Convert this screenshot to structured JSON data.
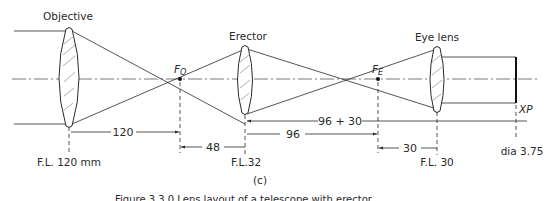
{
  "diagram": {
    "panel_label": "(c)",
    "caption_fragment": "Figure 3.3.0  Lens layout of a telescope with erector",
    "components": {
      "objective": {
        "label": "Objective",
        "focal_length_label": "F.L. 120 mm"
      },
      "erector": {
        "label": "Erector",
        "focal_length_label": "F.L.32"
      },
      "eye_lens": {
        "label": "Eye lens",
        "focal_length_label": "F.L. 30"
      },
      "exit_pupil": {
        "label": "XP",
        "diameter_label": "dia 3.75"
      }
    },
    "focal_points": {
      "objective_focus": {
        "main": "F",
        "sub": "O"
      },
      "eyepiece_focus": {
        "main": "F",
        "sub": "E"
      }
    },
    "dimensions": {
      "objective_to_fo": "120",
      "fo_to_erector": "48",
      "erector_to_fe": "96",
      "erector_to_xp": "96 + 30",
      "fe_to_eye": "30"
    },
    "colors": {
      "ink": "#2a2a2a",
      "hatch": "#8a8a8a",
      "background": "#ffffff"
    }
  }
}
